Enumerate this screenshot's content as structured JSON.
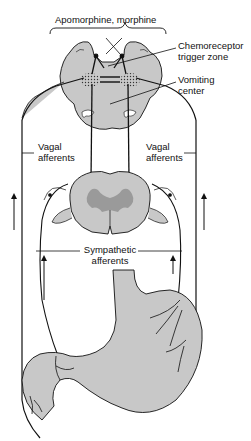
{
  "diagram": {
    "labels": {
      "drugs": "Apomorphine,  morphine",
      "ctz_line1": "Chemoreceptor",
      "ctz_line2": "trigger zone",
      "vc_line1": "Vomiting",
      "vc_line2": "center",
      "vagal_left_line1": "Vagal",
      "vagal_left_line2": "afferents",
      "vagal_right_line1": "Vagal",
      "vagal_right_line2": "afferents",
      "symp_line1": "Sympathetic",
      "symp_line2": "afferents"
    },
    "structures": [
      "brainstem (medulla)",
      "chemoreceptor trigger zone",
      "vomiting center",
      "spinal cord cross-section",
      "stomach and duodenum"
    ],
    "colors": {
      "tissue_fill": "#c8c8c8",
      "gray_matter": "#9a9a9a",
      "line": "#111111",
      "background": "#ffffff"
    }
  }
}
